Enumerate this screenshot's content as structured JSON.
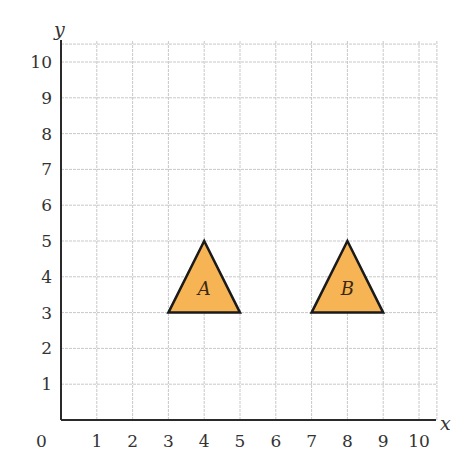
{
  "chart_data": {
    "type": "diagram",
    "title": "",
    "xlabel": "x",
    "ylabel": "y",
    "xlim": [
      0,
      10
    ],
    "ylim": [
      0,
      10
    ],
    "grid": true,
    "origin_label": "0",
    "x_ticks": [
      "1",
      "2",
      "3",
      "4",
      "5",
      "6",
      "7",
      "8",
      "9",
      "10"
    ],
    "y_ticks": [
      "1",
      "2",
      "3",
      "4",
      "5",
      "6",
      "7",
      "8",
      "9",
      "10"
    ],
    "shapes": [
      {
        "name": "A",
        "type": "triangle",
        "vertices": [
          [
            3,
            3
          ],
          [
            5,
            3
          ],
          [
            4,
            5
          ]
        ],
        "fill": "#F7B455"
      },
      {
        "name": "B",
        "type": "triangle",
        "vertices": [
          [
            7,
            3
          ],
          [
            9,
            3
          ],
          [
            8,
            5
          ]
        ],
        "fill": "#F7B455"
      }
    ]
  },
  "labels": {
    "x_axis": "x",
    "y_axis": "y",
    "origin": "0",
    "shape_a": "A",
    "shape_b": "B"
  },
  "colors": {
    "grid": "#c8c8c8",
    "axis": "#2a2a2a",
    "shape_fill": "#F7B455",
    "shape_stroke": "#1a1a1a"
  }
}
